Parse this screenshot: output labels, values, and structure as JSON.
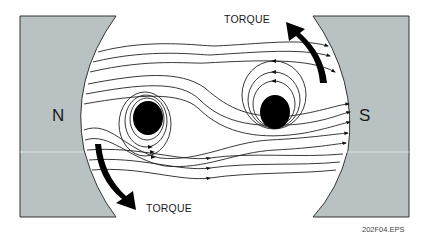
{
  "figure": {
    "id_label": "202F04.EPS"
  },
  "poles": {
    "north": {
      "label": "N",
      "color": "#b9c2c3"
    },
    "south": {
      "label": "S",
      "color": "#b9c2c3"
    }
  },
  "torque": {
    "top_label": "TORQUE",
    "bottom_label": "TORQUE"
  },
  "colors": {
    "pole_fill": "#b9c2c3",
    "line": "#222222",
    "conductor": "#000000",
    "background": "#ffffff"
  }
}
